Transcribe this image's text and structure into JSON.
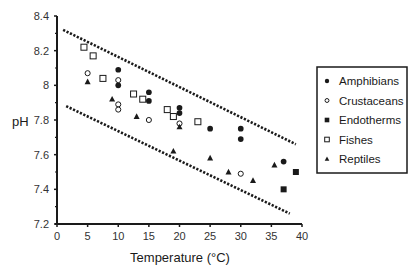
{
  "chart_data": {
    "type": "scatter",
    "title": "",
    "xlabel": "Temperature (°C)",
    "ylabel": "pH",
    "xlim": [
      0,
      40
    ],
    "ylim": [
      7.2,
      8.4
    ],
    "x_ticks": [
      0,
      5,
      10,
      15,
      20,
      25,
      30,
      35,
      40
    ],
    "y_ticks": [
      7.2,
      7.4,
      7.6,
      7.8,
      8.0,
      8.2,
      8.4
    ],
    "y_tick_labels": [
      "7.2",
      "7.4",
      "7.6",
      "7.8",
      "8",
      "8.2",
      "8.4"
    ],
    "grid": false,
    "legend_position": "right",
    "series": [
      {
        "name": "Amphibians",
        "marker": "filled-circle",
        "points": [
          [
            10,
            8.09
          ],
          [
            10,
            8.0
          ],
          [
            15,
            7.96
          ],
          [
            15,
            7.91
          ],
          [
            20,
            7.87
          ],
          [
            20,
            7.84
          ],
          [
            25,
            7.75
          ],
          [
            30,
            7.75
          ],
          [
            30,
            7.69
          ],
          [
            37,
            7.56
          ]
        ]
      },
      {
        "name": "Crustaceans",
        "marker": "open-circle",
        "points": [
          [
            5,
            8.07
          ],
          [
            10,
            8.03
          ],
          [
            10,
            7.89
          ],
          [
            10,
            7.86
          ],
          [
            15,
            7.8
          ],
          [
            20,
            7.78
          ],
          [
            30,
            7.49
          ]
        ]
      },
      {
        "name": "Endotherms",
        "marker": "filled-square",
        "points": [
          [
            39,
            7.5
          ],
          [
            37,
            7.4
          ]
        ]
      },
      {
        "name": "Fishes",
        "marker": "open-square",
        "points": [
          [
            4.4,
            8.22
          ],
          [
            5.9,
            8.17
          ],
          [
            7.5,
            8.04
          ],
          [
            12.5,
            7.95
          ],
          [
            14,
            7.92
          ],
          [
            18,
            7.86
          ],
          [
            19,
            7.82
          ],
          [
            23,
            7.79
          ]
        ]
      },
      {
        "name": "Reptiles",
        "marker": "filled-triangle",
        "points": [
          [
            5,
            8.02
          ],
          [
            9,
            7.92
          ],
          [
            13,
            7.82
          ],
          [
            20,
            7.76
          ],
          [
            19,
            7.62
          ],
          [
            25,
            7.58
          ],
          [
            28,
            7.5
          ],
          [
            32,
            7.45
          ],
          [
            35.5,
            7.54
          ]
        ]
      }
    ],
    "annotations": [
      {
        "type": "dotted-line",
        "label": "upper bound",
        "from": [
          1,
          8.32
        ],
        "to": [
          39,
          7.66
        ]
      },
      {
        "type": "dotted-line",
        "label": "lower bound",
        "from": [
          1.5,
          7.88
        ],
        "to": [
          38,
          7.26
        ]
      }
    ]
  },
  "axes": {
    "xlabel": "Temperature (°C)",
    "ylabel": "pH"
  },
  "legend": {
    "items": [
      {
        "label": "Amphibians",
        "marker": "filled-circle"
      },
      {
        "label": "Crustaceans",
        "marker": "open-circle"
      },
      {
        "label": "Endotherms",
        "marker": "filled-square"
      },
      {
        "label": "Fishes",
        "marker": "open-square"
      },
      {
        "label": "Reptiles",
        "marker": "filled-triangle"
      }
    ]
  },
  "colors": {
    "ink": "#1a1a1a",
    "background": "#ffffff"
  }
}
